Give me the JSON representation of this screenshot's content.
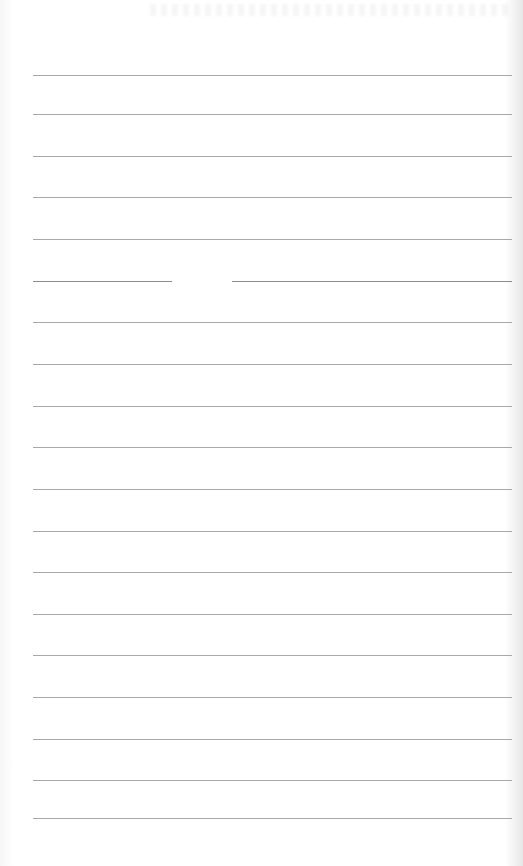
{
  "paper": {
    "type": "lined notebook paper",
    "content": "blank",
    "background_color": "#ffffff",
    "line_color": "#9a9a9a",
    "line_left_x": 33,
    "line_right_x": 512,
    "line_spacing_px": 39,
    "rules_y": [
      75,
      114,
      156,
      197,
      239,
      281,
      322,
      364,
      406,
      447,
      489,
      531,
      572,
      614,
      655,
      697,
      739,
      780,
      818
    ],
    "broken_rule": {
      "y": 281,
      "gap_start_x": 172,
      "gap_end_x": 232
    }
  }
}
